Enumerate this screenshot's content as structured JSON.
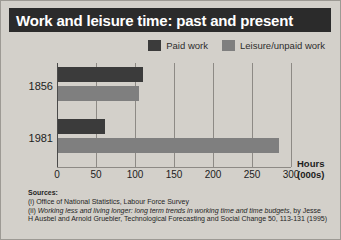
{
  "title": "Work and leisure time: past and present",
  "legend": [
    {
      "label": "Paid work",
      "color": "#3b3b3b",
      "name": "paid-work"
    },
    {
      "label": "Leisure/unpaid work",
      "color": "#7f7f7f",
      "name": "leisure-unpaid-work"
    }
  ],
  "axis": {
    "title_line1": "Hours",
    "title_line2": "(000s)",
    "ticks": [
      "0",
      "50",
      "100",
      "150",
      "200",
      "250",
      "300"
    ]
  },
  "categories": [
    "1856",
    "1981"
  ],
  "sources": {
    "heading": "Sources:",
    "line1": "(i) Office of National Statistics, Labour Force Survey",
    "line2_prefix": "(ii) ",
    "line2_italic": "Working less and living longer: long term trends in working time and time budgets",
    "line2_suffix": ", by Jesse",
    "line3": "H Ausbel and Arnold Gruebler, Technological Forecasting and Social Change 50, 113-131 (1995)"
  },
  "chart_data": {
    "type": "bar",
    "orientation": "horizontal",
    "title": "Work and leisure time: past and present",
    "xlabel": "Hours (000s)",
    "ylabel": "",
    "categories": [
      "1856",
      "1981"
    ],
    "series": [
      {
        "name": "Paid work",
        "color": "#3b3b3b",
        "values": [
          109,
          60
        ]
      },
      {
        "name": "Leisure/unpaid work",
        "color": "#7f7f7f",
        "values": [
          104,
          283
        ]
      }
    ],
    "xlim": [
      0,
      300
    ],
    "xticks": [
      0,
      50,
      100,
      150,
      200,
      250,
      300
    ],
    "grid": true,
    "legend_position": "top-right"
  }
}
